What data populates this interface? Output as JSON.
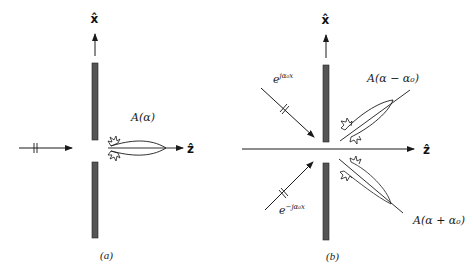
{
  "panels": [
    {
      "id": "a",
      "caption": "(a)",
      "x_axis_label": "x̂",
      "z_axis_label": "ẑ",
      "lobe_label": "A(α)"
    },
    {
      "id": "b",
      "caption": "(b)",
      "x_axis_label": "x̂",
      "z_axis_label": "ẑ",
      "upper_wave_label_base": "e",
      "upper_wave_label_exp": "jα₀x",
      "lower_wave_label_base": "e",
      "lower_wave_label_exp": "−jα₀x",
      "upper_lobe_label": "A(α − α₀)",
      "lower_lobe_label": "A(α + α₀)"
    }
  ],
  "colors": {
    "screen": "#555555",
    "line": "#1a1a1a",
    "background": "#ffffff"
  }
}
